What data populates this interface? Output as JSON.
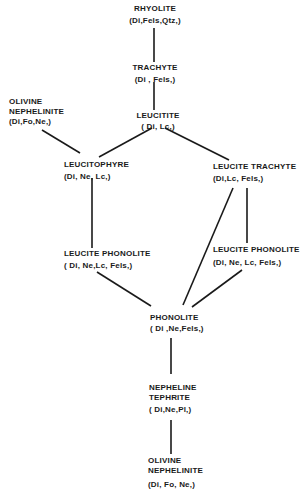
{
  "diagram": {
    "type": "rock-series-relationship",
    "nodes": [
      {
        "id": "rhyolite",
        "name_lines": [
          "RHYOLITE"
        ],
        "composition": "(Di,Fels,Qtz,)"
      },
      {
        "id": "trachyte",
        "name_lines": [
          "TRACHYTE"
        ],
        "composition": "(Di , Fels,)"
      },
      {
        "id": "olivine-nephelinite-top",
        "name_lines": [
          "OLIVINE",
          "NEPHELINITE"
        ],
        "composition": "(Di,Fo,Ne,)"
      },
      {
        "id": "leucitite",
        "name_lines": [
          "LEUCITITE"
        ],
        "composition": "( Di, Lc,)"
      },
      {
        "id": "leucitophyre",
        "name_lines": [
          "LEUCITOPHYRE"
        ],
        "composition": "(Di, Ne, Lc,)"
      },
      {
        "id": "leucite-trachyte",
        "name_lines": [
          "LEUCITE TRACHYTE"
        ],
        "composition": "(Di,Lc, Fels,)"
      },
      {
        "id": "leucite-phonolite-left",
        "name_lines": [
          "LEUCITE PHONOLITE"
        ],
        "composition": "( Di, Ne,Lc, Fels,)"
      },
      {
        "id": "leucite-phonolite-right",
        "name_lines": [
          "LEUCITE PHONOLITE"
        ],
        "composition": "(Di, Ne, Lc, Fels,)"
      },
      {
        "id": "phonolite",
        "name_lines": [
          "PHONOLITE"
        ],
        "composition": "( Di ,Ne,Fels,)"
      },
      {
        "id": "nepheline-tephrite",
        "name_lines": [
          "NEPHELINE",
          "TEPHRITE"
        ],
        "composition": "( Di,Ne,Pl,)"
      },
      {
        "id": "olivine-nephelinite-bottom",
        "name_lines": [
          "OLIVINE",
          "NEPHELINITE"
        ],
        "composition": "(Di, Fo, Ne,)"
      }
    ],
    "edges": [
      [
        "rhyolite",
        "trachyte"
      ],
      [
        "trachyte",
        "leucitite"
      ],
      [
        "olivine-nephelinite-top",
        "leucitophyre"
      ],
      [
        "leucitite",
        "leucitophyre"
      ],
      [
        "leucitite",
        "leucite-trachyte"
      ],
      [
        "leucitophyre",
        "leucite-phonolite-left"
      ],
      [
        "leucite-trachyte",
        "leucite-phonolite-right"
      ],
      [
        "leucite-trachyte",
        "phonolite"
      ],
      [
        "leucite-phonolite-left",
        "phonolite"
      ],
      [
        "leucite-phonolite-right",
        "phonolite"
      ],
      [
        "phonolite",
        "nepheline-tephrite"
      ],
      [
        "nepheline-tephrite",
        "olivine-nephelinite-bottom"
      ]
    ]
  }
}
